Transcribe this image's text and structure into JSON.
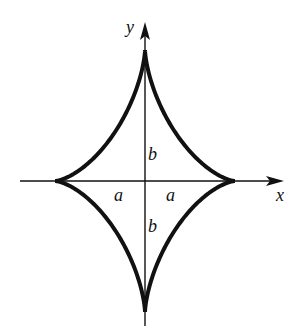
{
  "diagram": {
    "type": "astroid",
    "center": [
      145,
      181
    ],
    "semi_axis_x_px": 90,
    "semi_axis_y_px": 131,
    "curve_color": "#111111",
    "axis_color": "#111111"
  },
  "labels": {
    "x_axis": "x",
    "y_axis": "y",
    "a_left": "a",
    "a_right": "a",
    "b_top": "b",
    "b_bottom": "b"
  }
}
